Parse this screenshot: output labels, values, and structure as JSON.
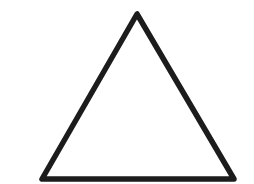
{
  "figure": {
    "shape": "triangle",
    "vertices": [
      [
        137,
        14
      ],
      [
        42,
        179
      ],
      [
        234,
        179
      ]
    ],
    "stroke_color": "#1c1c1c",
    "stroke_width": 5.5,
    "fill_color": "#ffffff"
  },
  "background_color": "#ffffff"
}
